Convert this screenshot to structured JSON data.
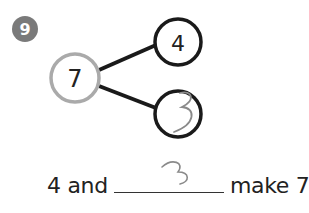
{
  "problem": {
    "number": "9",
    "badge_color": "#7a7a7a"
  },
  "number_bond": {
    "whole": "7",
    "part_top": "4",
    "part_bottom_handwritten": "3",
    "whole_circle_color": "#aaaaaa",
    "part_circle_color": "#1a1a1a"
  },
  "sentence": {
    "start": "4 and",
    "blank_handwritten": "3",
    "end": "make 7."
  }
}
